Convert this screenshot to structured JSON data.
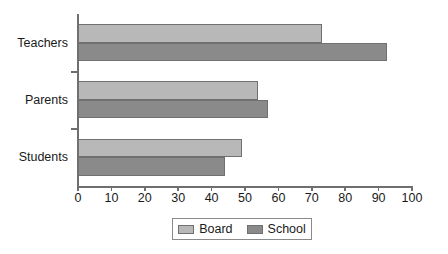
{
  "chart_data": {
    "type": "bar",
    "orientation": "horizontal",
    "title": "",
    "xlabel": "",
    "ylabel": "",
    "categories": [
      "Teachers",
      "Parents",
      "Students"
    ],
    "series": [
      {
        "name": "Board",
        "color": "#b8b8b8",
        "values": [
          73,
          54,
          49
        ]
      },
      {
        "name": "School",
        "color": "#8a8a8a",
        "values": [
          92.5,
          57,
          44
        ]
      }
    ],
    "xlim": [
      0,
      100
    ],
    "xticks": [
      0,
      10,
      20,
      30,
      40,
      50,
      60,
      70,
      80,
      90,
      100
    ],
    "xtick_labels": [
      "0",
      "10",
      "20",
      "30",
      "40",
      "50",
      "60",
      "70",
      "80",
      "90",
      "100"
    ],
    "grid": false,
    "legend_position": "bottom-center",
    "legend_entries": [
      "Board",
      "School"
    ],
    "axis_color": "#6f6f6f",
    "bar_border_color": "#707070",
    "background": "#ffffff"
  }
}
